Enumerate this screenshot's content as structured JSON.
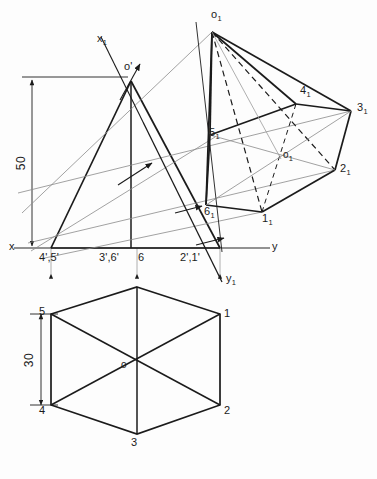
{
  "drawing": {
    "title": "Isometric projection of a hexagonal pyramid with front view and top view",
    "colors": {
      "line": "#1b1b1b",
      "axis": "#6e6e6e",
      "construction": "#8a8a8a",
      "hidden": "#1b1b1b",
      "background": "#fdfdfd"
    },
    "dimensions": [
      {
        "name": "height",
        "value": "50"
      },
      {
        "name": "across-flats",
        "value": "30"
      }
    ],
    "axes": {
      "x_label": "x",
      "y_label": "y",
      "x1_label": "x",
      "x1_sub": "1",
      "y1_label": "y",
      "y1_sub": "1"
    },
    "front_view": {
      "apex_label": "o'",
      "base_labels": [
        "4',5'",
        "3',6'",
        "6",
        "2',1'"
      ]
    },
    "top_view": {
      "center_label": "o",
      "vertex_labels": [
        "1",
        "2",
        "3",
        "4",
        "5"
      ]
    },
    "isometric": {
      "apex_label": "o",
      "apex_sub": "1",
      "center_label": "o",
      "center_sub": "1",
      "vertices": [
        {
          "label": "1",
          "sub": "1"
        },
        {
          "label": "2",
          "sub": "1"
        },
        {
          "label": "3",
          "sub": "1"
        },
        {
          "label": "4",
          "sub": "1"
        },
        {
          "label": "5",
          "sub": "1"
        },
        {
          "label": "6",
          "sub": "1"
        }
      ]
    }
  }
}
